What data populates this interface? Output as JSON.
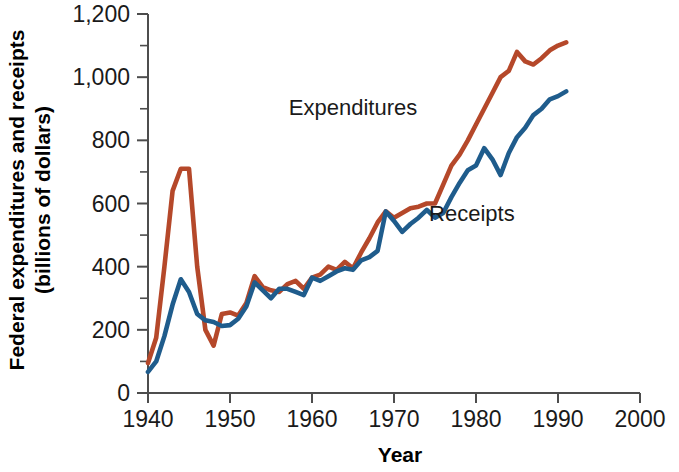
{
  "chart_data": {
    "type": "line",
    "title": "",
    "xlabel": "Year",
    "ylabel": "Federal expenditures and receipts (billions of dollars)",
    "ylabel_line1": "Federal expenditures and receipts",
    "ylabel_line2": "(billions of dollars)",
    "xlim": [
      1940,
      2000
    ],
    "ylim": [
      0,
      1200
    ],
    "xticks": [
      1940,
      1950,
      1960,
      1970,
      1980,
      1990,
      2000
    ],
    "xtick_labels": [
      "1940",
      "1950",
      "1960",
      "1970",
      "1980",
      "1990",
      "2000"
    ],
    "yticks": [
      0,
      200,
      400,
      600,
      800,
      1000,
      1200
    ],
    "ytick_labels": [
      "0",
      "200",
      "400",
      "600",
      "800",
      "1,000",
      "1,200"
    ],
    "y_minor_ticks": [
      100,
      300,
      500,
      700,
      900,
      1100
    ],
    "grid": false,
    "legend_position": "inline-annotations",
    "colors": {
      "expenditures": "#b5482a",
      "receipts": "#1f5c8c",
      "axis": "#4d4d4d",
      "text": "#1a1a1a",
      "background": "#ffffff"
    },
    "annotations": [
      {
        "text": "Expenditures",
        "x": 1965.0,
        "y": 880,
        "color": "#1a1a1a"
      },
      {
        "text": "Receipts",
        "x": 1979.5,
        "y": 545,
        "color": "#1a1a1a"
      }
    ],
    "x": [
      1940,
      1941,
      1942,
      1943,
      1944,
      1945,
      1946,
      1947,
      1948,
      1949,
      1950,
      1951,
      1952,
      1953,
      1954,
      1955,
      1956,
      1957,
      1958,
      1959,
      1960,
      1961,
      1962,
      1963,
      1964,
      1965,
      1966,
      1967,
      1968,
      1969,
      1970,
      1971,
      1972,
      1973,
      1974,
      1975,
      1976,
      1977,
      1978,
      1979,
      1980,
      1981,
      1982,
      1983,
      1984,
      1985,
      1986,
      1987,
      1988,
      1989,
      1990,
      1991
    ],
    "series": [
      {
        "name": "Expenditures",
        "color": "#b5482a",
        "values": [
          95,
          175,
          400,
          640,
          710,
          710,
          400,
          200,
          150,
          250,
          255,
          245,
          285,
          370,
          335,
          325,
          320,
          345,
          355,
          330,
          365,
          375,
          400,
          390,
          415,
          395,
          445,
          490,
          540,
          575,
          555,
          570,
          585,
          590,
          600,
          600,
          660,
          720,
          755,
          800,
          850,
          900,
          950,
          1000,
          1020,
          1080,
          1050,
          1040,
          1060,
          1085,
          1100,
          1110
        ]
      },
      {
        "name": "Receipts",
        "color": "#1f5c8c",
        "values": [
          67,
          100,
          180,
          280,
          360,
          320,
          250,
          230,
          225,
          212,
          215,
          235,
          275,
          350,
          325,
          300,
          330,
          330,
          320,
          310,
          365,
          355,
          370,
          385,
          395,
          390,
          420,
          430,
          450,
          575,
          545,
          510,
          535,
          555,
          580,
          555,
          570,
          620,
          665,
          705,
          720,
          775,
          740,
          690,
          760,
          810,
          840,
          880,
          900,
          930,
          940,
          955
        ]
      }
    ]
  }
}
